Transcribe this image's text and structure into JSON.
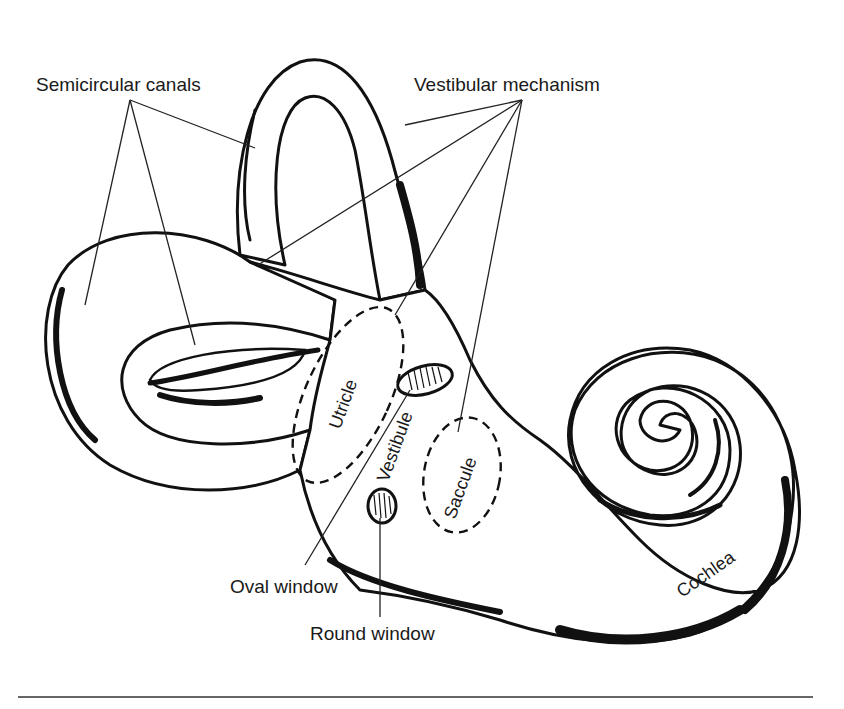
{
  "figure": {
    "labels": {
      "semicircular_canals": "Semicircular canals",
      "vestibular_mechanism": "Vestibular mechanism",
      "utricle": "Utricle",
      "vestibule": "Vestibule",
      "saccule": "Saccule",
      "oval_window": "Oval window",
      "round_window": "Round window",
      "cochlea": "Cochlea"
    },
    "colors": {
      "ink": "#111111",
      "background": "#ffffff"
    }
  }
}
